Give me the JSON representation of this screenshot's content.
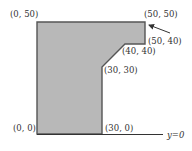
{
  "diagram": {
    "shape_fill": "#b8b8b8",
    "shape_stroke": "#555555",
    "vertices": [
      {
        "label": "(0, 50)"
      },
      {
        "label": "(50, 50)"
      },
      {
        "label": "(50, 40)"
      },
      {
        "label": "(40, 40)"
      },
      {
        "label": "(30, 30)"
      },
      {
        "label": "(30, 0)"
      },
      {
        "label": "(0, 0)"
      }
    ],
    "baseline_label": "y=0"
  }
}
